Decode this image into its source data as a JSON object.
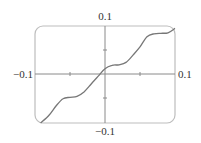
{
  "chart_data": {
    "type": "line",
    "title": "",
    "xlabel": "",
    "ylabel": "",
    "xlim": [
      -0.1,
      0.1
    ],
    "ylim": [
      -0.1,
      0.1
    ],
    "grid": false,
    "legend": null,
    "axis_labels": {
      "x_min": "−0.1",
      "x_max": "0.1",
      "y_min": "−0.1",
      "y_max": "0.1"
    },
    "x_ticks": [
      -0.05,
      0.05
    ],
    "y_ticks": [
      -0.05,
      0.05
    ],
    "series": [
      {
        "name": "f(x)",
        "x": [
          -0.092,
          -0.08,
          -0.07,
          -0.06,
          -0.05,
          -0.04,
          -0.03,
          -0.02,
          -0.01,
          0.0,
          0.01,
          0.02,
          0.03,
          0.04,
          0.05,
          0.06,
          0.07,
          0.08,
          0.09,
          0.1
        ],
        "y": [
          -0.1,
          -0.084,
          -0.065,
          -0.05,
          -0.047,
          -0.045,
          -0.036,
          -0.02,
          -0.004,
          0.012,
          0.019,
          0.02,
          0.025,
          0.04,
          0.057,
          0.078,
          0.084,
          0.085,
          0.086,
          0.095
        ]
      }
    ],
    "colors": {
      "curve": "#777777",
      "axes": "#8a8a8a",
      "frame": "#bdbdbd"
    }
  }
}
